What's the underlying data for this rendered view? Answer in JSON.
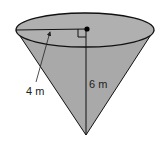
{
  "figure": {
    "shape": "cone",
    "radius_label": "4 m",
    "height_label": "6 m",
    "right_angle_marker": true,
    "center_point": true
  },
  "colors": {
    "fill": "#a9a9a9",
    "top_fill": "#b0b0b0",
    "stroke": "#111111",
    "background": "#ffffff"
  }
}
